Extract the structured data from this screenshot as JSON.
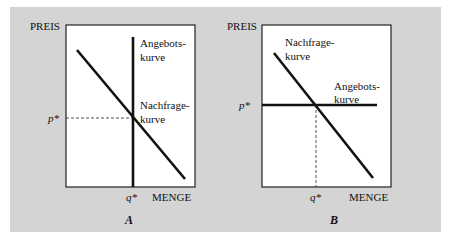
{
  "figure": {
    "panels": [
      {
        "id": "A",
        "caption": "A",
        "y_axis_label": "PREIS",
        "x_axis_label": "MENGE",
        "price_marker": "p*",
        "quantity_marker": "q*",
        "supply_label_line1": "Angebots-",
        "supply_label_line2": "kurve",
        "demand_label_line1": "Nachfrage-",
        "demand_label_line2": "kurve",
        "supply_shape": "vertical",
        "demand_shape": "downward-sloping"
      },
      {
        "id": "B",
        "caption": "B",
        "y_axis_label": "PREIS",
        "x_axis_label": "MENGE",
        "price_marker": "p*",
        "quantity_marker": "q*",
        "supply_label_line1": "Angebots-",
        "supply_label_line2": "kurve",
        "demand_label_line1": "Nachfrage-",
        "demand_label_line2": "kurve",
        "supply_shape": "horizontal",
        "demand_shape": "downward-sloping"
      }
    ],
    "colors": {
      "background": "#d4d4d4",
      "plot_area": "#ffffff",
      "line": "#111111"
    }
  }
}
